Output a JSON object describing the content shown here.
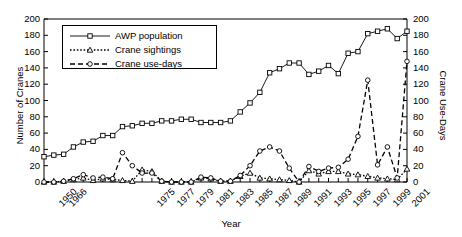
{
  "chart_data": {
    "type": "line",
    "title": "",
    "xlabel": "Year",
    "ylabel": "Number of Cranes",
    "ylabel_right": "Crane Use-Days",
    "ylim": [
      0,
      200
    ],
    "ylim_right": [
      0,
      200
    ],
    "grid": false,
    "legend_position": "upper-left-inside",
    "x_tick_labels": [
      "1950",
      "1966",
      "1975",
      "1977",
      "1979",
      "1981",
      "1983",
      "1985",
      "1987",
      "1989",
      "1991",
      "1993",
      "1995",
      "1997",
      "1999",
      "2001"
    ],
    "y_tick_labels": [
      "0",
      "20",
      "40",
      "60",
      "80",
      "100",
      "120",
      "140",
      "160",
      "180",
      "200"
    ],
    "y_tick_labels_right": [
      "0",
      "20",
      "40",
      "60",
      "80",
      "100",
      "120",
      "140",
      "160",
      "180",
      "200"
    ],
    "x": [
      1950,
      1966,
      1967,
      1968,
      1969,
      1970,
      1971,
      1972,
      1973,
      1974,
      1975,
      1976,
      1977,
      1978,
      1979,
      1980,
      1981,
      1982,
      1983,
      1984,
      1985,
      1986,
      1987,
      1988,
      1989,
      1990,
      1991,
      1992,
      1993,
      1994,
      1995,
      1996,
      1997,
      1998,
      1999,
      2000,
      2001,
      2002
    ],
    "series": [
      {
        "name": "AWP population",
        "axis": "left",
        "marker": "square",
        "linestyle": "solid",
        "color": "#000000",
        "values": [
          31,
          33,
          34,
          43,
          49,
          50,
          57,
          57,
          68,
          69,
          72,
          72,
          75,
          75,
          77,
          77,
          73,
          73,
          73,
          75,
          86,
          97,
          110,
          134,
          139,
          146,
          146,
          132,
          136,
          143,
          133,
          158,
          160,
          182,
          185,
          188,
          176,
          185
        ]
      },
      {
        "name": "Crane sightings",
        "axis": "left",
        "marker": "triangle",
        "linestyle": "dotted",
        "color": "#000000",
        "values": [
          0,
          0,
          1,
          3,
          5,
          2,
          4,
          3,
          2,
          1,
          15,
          13,
          1,
          0,
          0,
          0,
          5,
          4,
          1,
          1,
          7,
          11,
          5,
          4,
          3,
          2,
          0,
          14,
          10,
          13,
          13,
          10,
          9,
          7,
          5,
          4,
          3,
          16
        ]
      },
      {
        "name": "Crane use-days",
        "axis": "right",
        "marker": "circle",
        "linestyle": "dashed",
        "color": "#000000",
        "values": [
          0,
          0,
          1,
          4,
          9,
          5,
          6,
          4,
          36,
          20,
          11,
          11,
          1,
          0,
          0,
          0,
          6,
          5,
          1,
          1,
          8,
          20,
          38,
          43,
          38,
          17,
          0,
          19,
          13,
          17,
          18,
          28,
          56,
          125,
          21,
          43,
          5,
          148
        ]
      }
    ]
  },
  "legend": {
    "items": [
      {
        "label": "AWP population",
        "marker": "square",
        "style": "solid"
      },
      {
        "label": "Crane sightings",
        "marker": "triangle",
        "style": "dotted"
      },
      {
        "label": "Crane use-days",
        "marker": "circle",
        "style": "dashed"
      }
    ]
  }
}
